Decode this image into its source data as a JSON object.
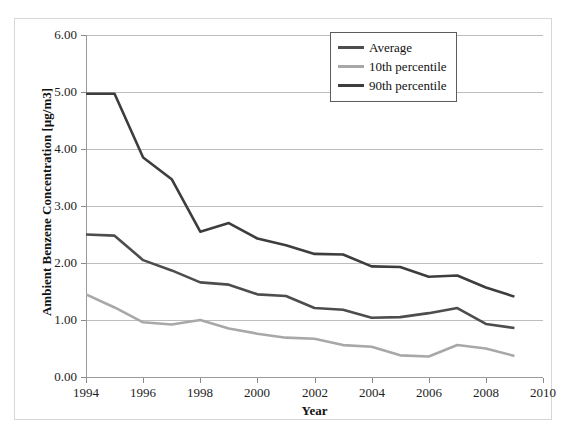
{
  "chart_data": {
    "type": "line",
    "title": "",
    "xlabel": "Year",
    "ylabel": "Ambient  Benzene Concentration  [µg/m3]",
    "xlim": [
      1994,
      2010
    ],
    "ylim": [
      0.0,
      6.0
    ],
    "grid": true,
    "legend_position": "top-right",
    "x": [
      1994,
      1995,
      1996,
      1997,
      1998,
      1999,
      2000,
      2001,
      2002,
      2003,
      2004,
      2005,
      2006,
      2007,
      2008,
      2009
    ],
    "xticks": [
      "1994",
      "1996",
      "1998",
      "2000",
      "2002",
      "2004",
      "2006",
      "2008",
      "2010"
    ],
    "xtick_values": [
      1994,
      1996,
      1998,
      2000,
      2002,
      2004,
      2006,
      2008,
      2010
    ],
    "yticks": [
      "0.00",
      "1.00",
      "2.00",
      "3.00",
      "4.00",
      "5.00",
      "6.00"
    ],
    "ytick_values": [
      0.0,
      1.0,
      2.0,
      3.0,
      4.0,
      5.0,
      6.0
    ],
    "series": [
      {
        "name": "Average",
        "color": "#4d4d4d",
        "values": [
          2.5,
          2.48,
          2.05,
          1.87,
          1.66,
          1.62,
          1.45,
          1.42,
          1.21,
          1.18,
          1.04,
          1.05,
          1.12,
          1.21,
          0.93,
          0.86
        ]
      },
      {
        "name": "10th percentile",
        "color": "#a8a8a8",
        "values": [
          1.45,
          1.22,
          0.96,
          0.92,
          1.0,
          0.85,
          0.76,
          0.69,
          0.67,
          0.56,
          0.53,
          0.38,
          0.36,
          0.56,
          0.5,
          0.37
        ]
      },
      {
        "name": "90th percentile",
        "color": "#3d3d3d",
        "values": [
          4.97,
          4.97,
          3.85,
          3.47,
          2.55,
          2.7,
          2.43,
          2.31,
          2.16,
          2.15,
          1.94,
          1.93,
          1.76,
          1.78,
          1.57,
          1.41
        ]
      }
    ]
  },
  "axes": {
    "x_title": "Year",
    "y_title": "Ambient  Benzene Concentration  [µg/m3]"
  },
  "legend": {
    "entries": [
      {
        "label": "Average",
        "color": "#4d4d4d"
      },
      {
        "label": "10th percentile",
        "color": "#a8a8a8"
      },
      {
        "label": "90th percentile",
        "color": "#3d3d3d"
      }
    ]
  },
  "colors": {
    "gridline": "#bdbdbd",
    "axis": "#9a9a9a",
    "text": "#111111",
    "figure_border": "#d7d7d7"
  }
}
